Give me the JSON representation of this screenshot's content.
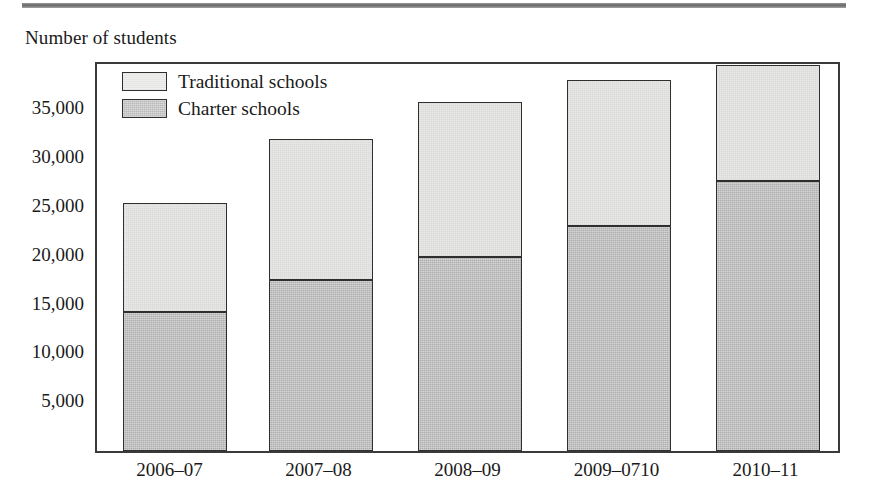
{
  "figure": {
    "axis_title": "Number of students",
    "top_rule_color": "#5a5a5a"
  },
  "legend": {
    "position": "top-left-inside",
    "entries": [
      {
        "label": "Traditional schools",
        "swatch": "light-gray-square-icon",
        "color": "#e9e9e7"
      },
      {
        "label": "Charter schools",
        "swatch": "dark-gray-square-icon",
        "color": "#aeaeae"
      }
    ]
  },
  "chart_data": {
    "type": "bar",
    "stacked": true,
    "title": "",
    "subtitle": "",
    "xlabel": "",
    "ylabel": "Number of students",
    "ylim": [
      0,
      39750
    ],
    "yticks": [
      5000,
      10000,
      15000,
      20000,
      25000,
      30000,
      35000
    ],
    "ytick_labels": [
      "5,000",
      "10,000",
      "15,000",
      "20,000",
      "25,000",
      "30,000",
      "35,000"
    ],
    "grid": false,
    "legend_position": "upper left",
    "categories": [
      "2006–07",
      "2007–08",
      "2008–09",
      "2009–0710",
      "2010–11"
    ],
    "series": [
      {
        "name": "Charter schools",
        "color": "#aeaeae",
        "values": [
          14250,
          17500,
          19850,
          23100,
          27700
        ]
      },
      {
        "name": "Traditional schools",
        "color": "#e9e9e7",
        "values": [
          11200,
          14450,
          15950,
          14950,
          11800
        ]
      }
    ],
    "totals": [
      25450,
      31950,
      35800,
      38050,
      39500
    ]
  }
}
